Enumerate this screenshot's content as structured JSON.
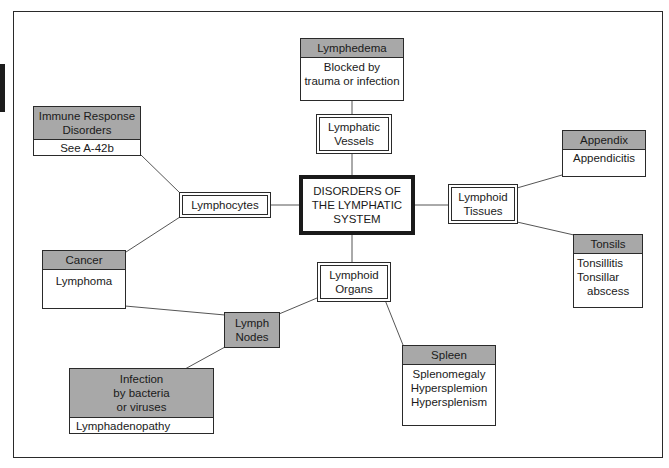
{
  "diagram": {
    "center": {
      "lines": [
        "DISORDERS OF",
        "THE LYMPHATIC",
        "SYSTEM"
      ]
    },
    "hubs": {
      "lymphatic_vessels": {
        "lines": [
          "Lymphatic",
          "Vessels"
        ]
      },
      "lymphocytes": {
        "lines": [
          "Lymphocytes"
        ]
      },
      "lymphoid_tissues": {
        "lines": [
          "Lymphoid",
          "Tissues"
        ]
      },
      "lymphoid_organs": {
        "lines": [
          "Lymphoid",
          "Organs"
        ]
      },
      "lymph_nodes": {
        "lines": [
          "Lymph",
          "Nodes"
        ]
      }
    },
    "cards": {
      "lymphedema": {
        "head": "Lymphedema",
        "body": [
          "Blocked by",
          "trauma or infection"
        ]
      },
      "immune_response": {
        "head_lines": [
          "Immune Response",
          "Disorders"
        ],
        "body": [
          "See A-42b"
        ]
      },
      "appendix": {
        "head": "Appendix",
        "body": [
          "Appendicitis"
        ]
      },
      "tonsils": {
        "head": "Tonsils",
        "body": [
          "Tonsillitis",
          "Tonsillar",
          "abscess"
        ]
      },
      "cancer": {
        "head": "Cancer",
        "body": [
          "Lymphoma"
        ]
      },
      "spleen": {
        "head": "Spleen",
        "body": [
          "Splenomegaly",
          "Hypersplemion",
          "Hypersplenism"
        ]
      },
      "infection": {
        "head_lines": [
          "Infection",
          "by bacteria",
          "or viruses"
        ],
        "body": [
          "Lymphadenopathy"
        ]
      }
    },
    "colors": {
      "header_fill": "#a8a8a8",
      "stroke": "#2a2a2a",
      "background": "#ffffff"
    }
  }
}
